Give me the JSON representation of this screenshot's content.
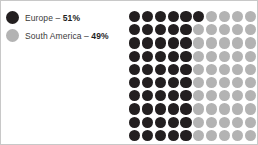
{
  "chart_data": {
    "type": "pie",
    "subtype": "waffle-dot-matrix",
    "title": "",
    "xlabel": "",
    "ylabel": "",
    "categories": [
      "Europe",
      "South America"
    ],
    "values": [
      51,
      49
    ],
    "unit": "%",
    "total_dots": 100,
    "grid": {
      "columns": 10,
      "rows": 10,
      "fill_order": "column-major-top-to-bottom"
    },
    "legend": {
      "position": "left",
      "entries": [
        "Europe – 51%",
        "South America – 49%"
      ]
    },
    "colors": {
      "europe": "#231f20",
      "south_america": "#b3b3b3",
      "background": "#ffffff",
      "border": "#c8c8c8",
      "text": "#3a3a3a",
      "value_text": "#1e1e1e"
    }
  },
  "legend": {
    "items": [
      {
        "label": "Europe",
        "separator": " – ",
        "value": "51%",
        "swatch_name": "europe-swatch",
        "color": "#231f20"
      },
      {
        "label": "South America",
        "separator": " – ",
        "value": "49%",
        "swatch_name": "south-america-swatch",
        "color": "#b3b3b3"
      }
    ]
  }
}
